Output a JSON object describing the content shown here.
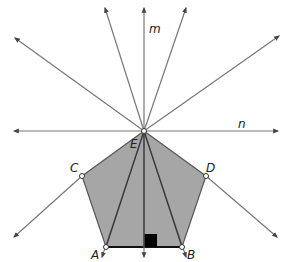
{
  "diagram": {
    "type": "geometry",
    "colors": {
      "pentagon_fill": "#a6a6a6",
      "line": "#777777",
      "edge": "#555555",
      "base": "#111111",
      "right_angle_marker": "#000000",
      "background": "#ffffff"
    },
    "labels": {
      "line_m": "m",
      "line_n": "n",
      "point_E": "E",
      "point_C": "C",
      "point_D": "D",
      "point_A": "A",
      "point_B": "B"
    },
    "points": {
      "E": [
        144,
        131
      ],
      "C": [
        82,
        176
      ],
      "D": [
        206,
        176
      ],
      "A": [
        106,
        247
      ],
      "B": [
        182,
        247
      ]
    },
    "rays_from_E": [
      {
        "name": "m-up",
        "to": [
          144,
          8
        ]
      },
      {
        "name": "ray-upper-left-steep",
        "to": [
          105,
          8
        ]
      },
      {
        "name": "ray-upper-right-steep",
        "to": [
          186,
          8
        ]
      },
      {
        "name": "ray-upper-left",
        "to": [
          15,
          38
        ]
      },
      {
        "name": "ray-upper-right",
        "to": [
          279,
          36
        ]
      },
      {
        "name": "n-left",
        "to": [
          14,
          131
        ]
      },
      {
        "name": "n-right",
        "to": [
          278,
          131
        ]
      },
      {
        "name": "ray-through-C",
        "to": [
          14,
          237
        ]
      },
      {
        "name": "ray-through-D",
        "to": [
          277,
          237
        ]
      },
      {
        "name": "ray-through-A",
        "to": [
          102,
          257
        ]
      },
      {
        "name": "m-down",
        "to": [
          144,
          257
        ]
      },
      {
        "name": "ray-through-B",
        "to": [
          186,
          257
        ]
      }
    ],
    "right_angle_marker": {
      "at": [
        144,
        247
      ],
      "size": 13
    }
  }
}
